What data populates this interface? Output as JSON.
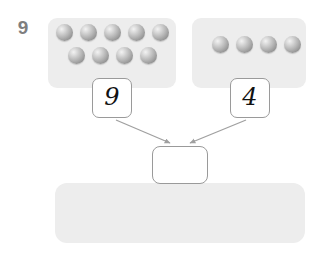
{
  "canvas": {
    "width": 320,
    "height": 254,
    "background": "#ffffff"
  },
  "palette": {
    "panel_fill": "#ededed",
    "ball_gray": "#b3b3b3",
    "outline_gray": "#9a9a9a",
    "arrow_gray": "#a0a0a0",
    "label_gray": "#7f7f7f",
    "digit_black": "#111111"
  },
  "total_label": {
    "value": "9"
  },
  "groups": [
    {
      "id": "left-group",
      "count_label": "9",
      "ball_count": 9,
      "rows": [
        {
          "count": 5,
          "balls": [
            {
              "x": 56,
              "y": 24
            },
            {
              "x": 80,
              "y": 24
            },
            {
              "x": 104,
              "y": 24
            },
            {
              "x": 128,
              "y": 24
            },
            {
              "x": 152,
              "y": 24
            }
          ]
        },
        {
          "count": 4,
          "balls": [
            {
              "x": 68,
              "y": 47
            },
            {
              "x": 92,
              "y": 47
            },
            {
              "x": 116,
              "y": 47
            },
            {
              "x": 140,
              "y": 47
            }
          ]
        }
      ]
    },
    {
      "id": "right-group",
      "count_label": "4",
      "ball_count": 4,
      "rows": [
        {
          "count": 4,
          "balls": [
            {
              "x": 212,
              "y": 36
            },
            {
              "x": 236,
              "y": 36
            },
            {
              "x": 260,
              "y": 36
            },
            {
              "x": 284,
              "y": 36
            }
          ]
        }
      ]
    }
  ],
  "answer": {
    "value": "",
    "placeholder": ""
  },
  "bottom_tray": {
    "ball_count": 0,
    "balls": []
  },
  "arrows": [
    {
      "id": "arrow-left-to-answer",
      "from": [
        116,
        120
      ],
      "to": [
        172,
        144
      ]
    },
    {
      "id": "arrow-right-to-answer",
      "from": [
        246,
        120
      ],
      "to": [
        188,
        144
      ]
    }
  ]
}
